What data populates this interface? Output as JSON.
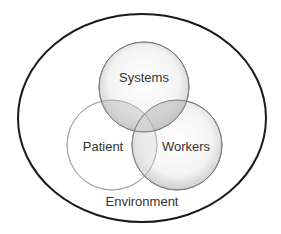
{
  "diagram": {
    "type": "venn",
    "container": {
      "label": "Environment"
    },
    "sets": [
      {
        "id": "systems",
        "label": "Systems"
      },
      {
        "id": "patient",
        "label": "Patient"
      },
      {
        "id": "workers",
        "label": "Workers"
      }
    ],
    "colors": {
      "outline_outer": "#1a1a1a",
      "circle_stroke": "#8c8c8c",
      "shade_light": "#ffffff",
      "shade_dark": "#d4d4d4",
      "overlap": "#b8b8b8",
      "text": "#333333"
    }
  }
}
